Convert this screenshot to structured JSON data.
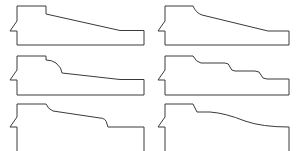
{
  "figure": {
    "stroke_color": "#3a3a3a",
    "background": "#ffffff",
    "profiles": [
      {
        "id": "profile-1",
        "label": "straight bevel",
        "d": "M17,6 L46,6 L46,14 L120,30.5 L144,30.5 L144,45 L17,45 L17,31 L10,31 L17,21 Z"
      },
      {
        "id": "profile-2",
        "label": "eased bevel",
        "d": "M165,6 L193,6 Q196,13 202,15 L268,31 L289,31 L289,45 L165,45 L165,31 L158,31 L165,21 Z"
      },
      {
        "id": "profile-3",
        "label": "ogee step then bevel",
        "d": "M17,56 L46,56 L46,60 Q52,60 56,63 Q62,68 62,73 L120,79.5 L144,79.5 L144,95 L17,95 L17,80 L10,80 L17,70 Z"
      },
      {
        "id": "profile-4",
        "label": "triple step",
        "d": "M165,56 L193,56 Q196,62 201,63 L225,63 Q229,63 230,67 Q231,71 235,71 L255,71 Q260,71 261,75 Q262,79 267,79 L289,79 L289,95 L165,95 L165,80 L158,80 L165,70 Z"
      },
      {
        "id": "profile-5",
        "label": "bevel with cove drop",
        "d": "M17,104 L46,104 Q48,109 53,111 L100,118 Q106,118 107,124 L108,127 L144,127 L144,152 L17,152 L17,127 L10,127 L17,117 Z"
      },
      {
        "id": "profile-6",
        "label": "S-curve",
        "d": "M165,104 L193,104 L197,112 L210,112 Q225,113 245,121 Q262,127 289,127 L289,152 L165,152 L165,127 L158,127 L165,117 Z"
      }
    ]
  }
}
